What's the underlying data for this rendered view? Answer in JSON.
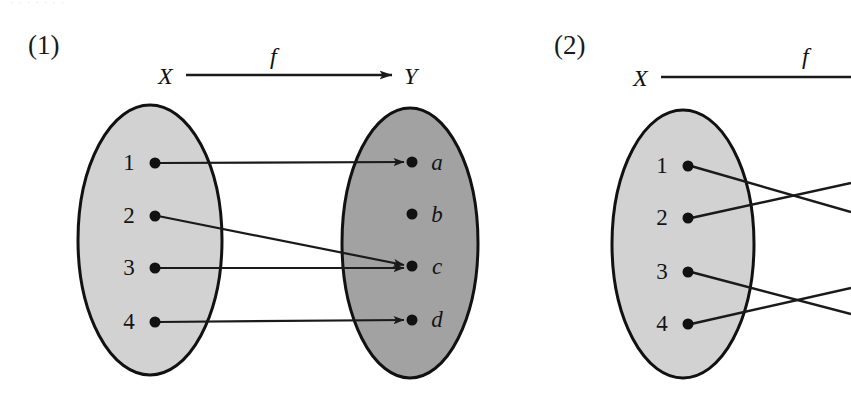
{
  "page": {
    "width": 851,
    "height": 411,
    "background": "#ffffff",
    "bleed_text": "· · ·   · ·    ·  ·"
  },
  "colors": {
    "domain_fill": "#d2d2d2",
    "codomain_fill": "#a2a2a2",
    "outline": "#111111",
    "line": "#1a1a1a",
    "text": "#121212",
    "node_dot": "#111111"
  },
  "diagrams": [
    {
      "id": "diagram-1",
      "number": "(1)",
      "header": {
        "domain_label": "X",
        "map_label": "f",
        "codomain_label": "Y",
        "arrow": "right-arrow"
      },
      "domain": {
        "name": "X",
        "fill": "#d2d2d2",
        "cx": 150,
        "cy": 240,
        "rx": 72,
        "ry": 135,
        "nodes": [
          {
            "label": "1",
            "x": 155,
            "y": 163,
            "italic": false
          },
          {
            "label": "2",
            "x": 155,
            "y": 216,
            "italic": false
          },
          {
            "label": "3",
            "x": 155,
            "y": 268,
            "italic": false
          },
          {
            "label": "4",
            "x": 155,
            "y": 322,
            "italic": false
          }
        ]
      },
      "codomain": {
        "name": "Y",
        "fill": "#a2a2a2",
        "cx": 410,
        "cy": 243,
        "rx": 68,
        "ry": 135,
        "nodes": [
          {
            "label": "a",
            "x": 412,
            "y": 162,
            "italic": true
          },
          {
            "label": "b",
            "x": 412,
            "y": 214,
            "italic": true
          },
          {
            "label": "c",
            "x": 412,
            "y": 266,
            "italic": true
          },
          {
            "label": "d",
            "x": 412,
            "y": 320,
            "italic": true
          }
        ]
      },
      "mappings": [
        {
          "from": "1",
          "to": "a",
          "x1": 158,
          "y1": 163,
          "x2": 404,
          "y2": 162
        },
        {
          "from": "2",
          "to": "c",
          "x1": 158,
          "y1": 216,
          "x2": 404,
          "y2": 265
        },
        {
          "from": "3",
          "to": "c",
          "x1": 158,
          "y1": 268,
          "x2": 404,
          "y2": 268
        },
        {
          "from": "4",
          "to": "d",
          "x1": 158,
          "y1": 322,
          "x2": 404,
          "y2": 320
        }
      ]
    },
    {
      "id": "diagram-2",
      "number": "(2)",
      "header": {
        "domain_label": "X",
        "map_label": "f",
        "codomain_label": "",
        "arrow": "line-truncated"
      },
      "domain": {
        "name": "X",
        "fill": "#d2d2d2",
        "cx": 143,
        "cy": 244,
        "rx": 71,
        "ry": 134,
        "nodes": [
          {
            "label": "1",
            "x": 148,
            "y": 166,
            "italic": false
          },
          {
            "label": "2",
            "x": 148,
            "y": 218,
            "italic": false
          },
          {
            "label": "3",
            "x": 148,
            "y": 272,
            "italic": false
          },
          {
            "label": "4",
            "x": 148,
            "y": 324,
            "italic": false
          }
        ]
      },
      "codomain": null,
      "mappings": [
        {
          "from": "1",
          "to": "",
          "x1": 151,
          "y1": 166,
          "x2": 311,
          "y2": 212
        },
        {
          "from": "2",
          "to": "",
          "x1": 151,
          "y1": 218,
          "x2": 311,
          "y2": 183
        },
        {
          "from": "3",
          "to": "",
          "x1": 151,
          "y1": 272,
          "x2": 311,
          "y2": 314
        },
        {
          "from": "4",
          "to": "",
          "x1": 151,
          "y1": 324,
          "x2": 311,
          "y2": 288
        }
      ]
    }
  ]
}
